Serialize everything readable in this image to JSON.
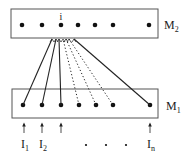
{
  "diagram": {
    "top_layer": {
      "label": "M",
      "subscript": "2",
      "box": {
        "x": 11,
        "y": 9,
        "w": 147,
        "h": 29
      },
      "nodes_x": [
        22,
        42,
        61,
        78,
        95,
        113,
        149
      ],
      "node_y": 25,
      "highlight_node_label": "i",
      "highlight_node_index": 2
    },
    "bottom_layer": {
      "label": "M",
      "subscript": "1",
      "box": {
        "x": 12,
        "y": 89,
        "w": 146,
        "h": 29
      },
      "nodes_x": [
        23,
        42,
        61,
        79,
        96,
        113,
        150
      ],
      "node_y": 105
    },
    "inputs": [
      {
        "label": "I",
        "subscript": "1",
        "x": 24
      },
      {
        "label": "I",
        "subscript": "2",
        "x": 42
      },
      {
        "label": "",
        "subscript": "",
        "x": 61
      },
      {
        "label": "I",
        "subscript": "n",
        "x": 150
      }
    ],
    "ellipsis_x": [
      86,
      106,
      126
    ],
    "connections": {
      "target_node_index": 2,
      "solid_from_bottom": [
        0,
        1,
        2,
        6
      ],
      "dotted_from_bottom": [
        3,
        4,
        5
      ]
    },
    "colors": {
      "line": "#222222",
      "box": "#555555",
      "node": "#111111"
    }
  }
}
